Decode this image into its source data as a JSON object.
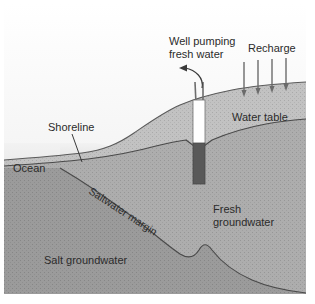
{
  "figure": {
    "frame": {
      "x": 4,
      "y": 4,
      "width": 302,
      "height": 290
    }
  },
  "colors": {
    "sky_top": "#ffffff",
    "sky_bottom": "#e2e2e2",
    "ocean_light": "#efefef",
    "ocean_dark": "#d2d2d2",
    "unsaturated_zone": "#c2c2c2",
    "fresh_groundwater": "#acacac",
    "salt_groundwater": "#9a9a9a",
    "well_casing_dry": "#ffffff",
    "well_casing_wet": "#595959",
    "line": "#4a4a4a",
    "label_text": "#2b2b2b"
  },
  "labels": {
    "well": {
      "line1": "Well pumping",
      "line2": "fresh water"
    },
    "recharge": "Recharge",
    "water_table": "Water table",
    "shoreline": "Shoreline",
    "ocean": "Ocean",
    "saltwater_margin": "Saltwater margin",
    "fresh_groundwater": {
      "line1": "Fresh",
      "line2": "groundwater"
    },
    "salt_groundwater": "Salt groundwater"
  },
  "elements": {
    "recharge_arrow_count": 4,
    "recharge_arrow_x": [
      244,
      258,
      272,
      286
    ],
    "well_riser_count": 2,
    "well_x": 199,
    "well_top_y": 78,
    "well_bottom_y": 184
  },
  "icons": {
    "recharge_arrow": "down-arrow-icon",
    "well_callout_arrow": "curved-arrow-icon",
    "shoreline_leader": "leader-line-icon"
  }
}
